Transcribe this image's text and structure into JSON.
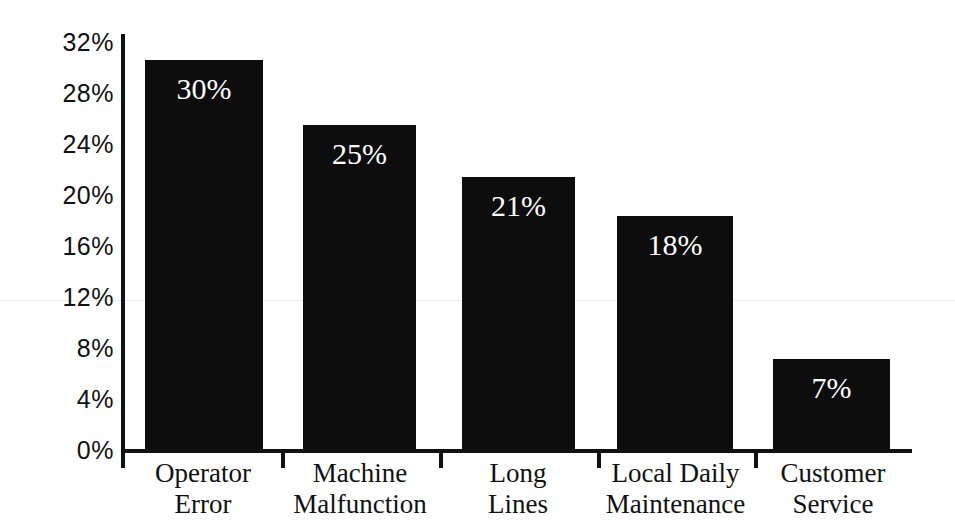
{
  "chart_data": {
    "type": "bar",
    "title": "",
    "subtitle": "",
    "xlabel": "",
    "ylabel": "",
    "categories": [
      "Operator Error",
      "Machine Malfunction",
      "Long Lines",
      "Local Daily Maintenance",
      "Customer Service"
    ],
    "category_lines": [
      [
        "Operator",
        "Error"
      ],
      [
        "Machine",
        "Malfunction"
      ],
      [
        "Long",
        "Lines"
      ],
      [
        "Local Daily",
        "Maintenance"
      ],
      [
        "Customer",
        "Service"
      ]
    ],
    "values": [
      30,
      25,
      21,
      18,
      7
    ],
    "data_labels": [
      "30%",
      "25%",
      "21%",
      "18%",
      "7%"
    ],
    "ylim": [
      0,
      32
    ],
    "yticks": [
      0,
      4,
      8,
      12,
      16,
      20,
      24,
      28,
      32
    ],
    "ytick_labels": [
      "0%",
      "4%",
      "8%",
      "12%",
      "16%",
      "20%",
      "24%",
      "28%",
      "32%"
    ],
    "grid": false,
    "legend": "none",
    "bar_color": "#0d0d0d",
    "data_label_color": "#ffffff",
    "axis_color": "#111111",
    "background_color": "#ffffff"
  }
}
